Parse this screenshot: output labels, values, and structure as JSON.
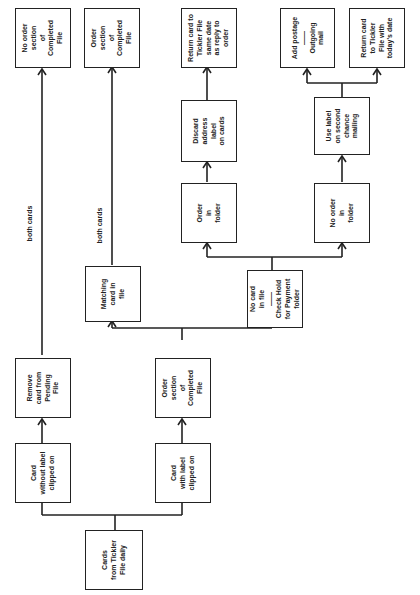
{
  "diagram": {
    "type": "flowchart",
    "orientation": "rotated-90-counterclockwise",
    "nodes": {
      "start": "Cards\nfrom Tickler\nFile daily",
      "card_without_label": "Card\nwithout label\nclipped on",
      "card_with_label": "Card\nwith label\nclipped on",
      "remove_card_pending": "Remove\ncard from\nPending\nFile",
      "order_section_completed_1": "Order\nsection\nof\nCompleted\nFile",
      "matching_card": "Matching\ncard in\nfile",
      "no_card_in_file": "No card\nin file\n——\nCheck Hold\nfor Payment\nfolder",
      "no_order_section_completed": "No order\nsection\nof\nCompleted\nFile",
      "order_section_completed_2": "Order\nsection\nof\nCompleted\nFile",
      "order_in_folder": "Order\nin\nfolder",
      "no_order_in_folder": "No order\nin\nfolder",
      "discard_address_label": "Discard\naddress\nlabel\non cards",
      "use_label_second_mailing": "Use label\non second\nchance\nmailing",
      "return_card_same_date": "Return card to\nTickler File\nsame date\nas reply to\norder",
      "add_postage": "Add postage\n——\nOutgoing\nmail",
      "return_card_today": "Return card\nto Tickler\nFile with\ntoday's date"
    },
    "edge_labels": {
      "both_cards_1": "both cards",
      "both_cards_2": "both cards"
    },
    "edges": [
      [
        "start",
        "card_without_label"
      ],
      [
        "start",
        "card_with_label"
      ],
      [
        "card_without_label",
        "remove_card_pending"
      ],
      [
        "remove_card_pending",
        "no_order_section_completed",
        "both cards"
      ],
      [
        "card_with_label",
        "order_section_completed_1"
      ],
      [
        "order_section_completed_1",
        "matching_card"
      ],
      [
        "order_section_completed_1",
        "no_card_in_file"
      ],
      [
        "matching_card",
        "order_section_completed_2",
        "both cards"
      ],
      [
        "no_card_in_file",
        "order_in_folder"
      ],
      [
        "no_card_in_file",
        "no_order_in_folder"
      ],
      [
        "order_in_folder",
        "discard_address_label"
      ],
      [
        "discard_address_label",
        "return_card_same_date"
      ],
      [
        "no_order_in_folder",
        "use_label_second_mailing"
      ],
      [
        "use_label_second_mailing",
        "add_postage"
      ],
      [
        "use_label_second_mailing",
        "return_card_today"
      ]
    ]
  }
}
